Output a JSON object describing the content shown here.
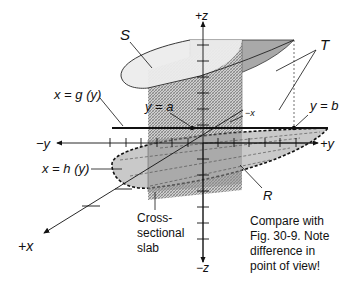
{
  "figure": {
    "labels": {
      "S": "S",
      "T": "T",
      "R": "R",
      "x_eq_g": "x = g (y)",
      "x_eq_h": "x = h (y)",
      "y_eq_a": "y = a",
      "y_eq_b": "y = b",
      "plus_z": "+z",
      "minus_z": "−z",
      "plus_y": "+y",
      "minus_y": "−y",
      "plus_x": "+x",
      "minus_x": "−x",
      "slab_line1": "Cross-",
      "slab_line2": "sectional",
      "slab_line3": "slab"
    },
    "note": {
      "line1": "Compare with",
      "line2": "Fig. 30-9. Note",
      "line3": "difference in",
      "line4": "point of view!"
    },
    "colors": {
      "light_gray": "#e6e6e6",
      "mid_gray": "#bdbdbd",
      "dark_gray": "#8f8f8f",
      "ink": "#111111"
    }
  }
}
